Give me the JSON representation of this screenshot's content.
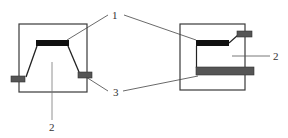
{
  "diagram": {
    "type": "schematic",
    "figures": [
      {
        "id": "left",
        "description": "Trapezoidal (sloped sidewall) structure inside square frame",
        "labels": {
          "top_bar": "1",
          "body": "2",
          "side_tabs": "3"
        }
      },
      {
        "id": "right",
        "description": "Vertical-wall structure inside square frame with top bar, bottom bar and offset tab",
        "labels": {
          "top_bar": "1",
          "body": "2",
          "bottom_bar": "3"
        }
      }
    ],
    "callouts": {
      "label_1": "1",
      "label_2_left": "2",
      "label_2_right": "2",
      "label_3": "3"
    },
    "colors": {
      "frame": "#3a3a3a",
      "black_bar": "#111111",
      "gray_bar": "#555555",
      "leader": "#444444"
    }
  }
}
